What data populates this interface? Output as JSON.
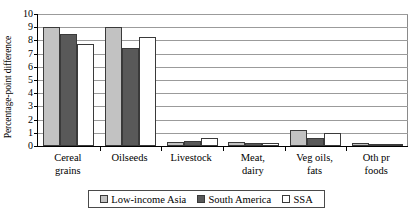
{
  "chart_data": {
    "type": "bar",
    "title": "",
    "subtitle": "",
    "xlabel": "",
    "ylabel": "Percentage-point difference",
    "ylim": [
      0,
      10
    ],
    "ytick_step": 1,
    "yticks": [
      "10",
      "9",
      "8",
      "7",
      "6",
      "5",
      "4",
      "3",
      "2",
      "1",
      "0"
    ],
    "grid": true,
    "grid_axis": "y",
    "legend_position": "bottom",
    "categories": [
      "Cereal grains",
      "Oilseeds",
      "Livestock",
      "Meat, dairy",
      "Veg oils, fats",
      "Oth pr foods"
    ],
    "category_lines": [
      [
        "Cereal",
        "grains"
      ],
      [
        "Oilseeds",
        ""
      ],
      [
        "Livestock",
        ""
      ],
      [
        "Meat,",
        "dairy"
      ],
      [
        "Veg oils,",
        "fats"
      ],
      [
        "Oth pr",
        "foods"
      ]
    ],
    "series": [
      {
        "name": "Low-income Asia",
        "color": "#c2c2c2",
        "values": [
          9.0,
          9.0,
          0.3,
          0.3,
          1.25,
          0.25
        ]
      },
      {
        "name": "South America",
        "color": "#595959",
        "values": [
          8.5,
          7.4,
          0.4,
          0.2,
          0.6,
          0.15
        ]
      },
      {
        "name": "SSA",
        "color": "#ffffff",
        "values": [
          7.7,
          8.25,
          0.6,
          0.2,
          0.95,
          0.12
        ]
      }
    ]
  },
  "legend": {
    "items": [
      {
        "label": "Low-income Asia"
      },
      {
        "label": "South America"
      },
      {
        "label": "SSA"
      }
    ]
  }
}
